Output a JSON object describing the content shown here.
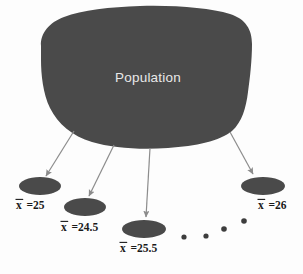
{
  "canvas": {
    "width": 303,
    "height": 274,
    "background_color": "#fdfdfd"
  },
  "colors": {
    "blob_fill": "#4a4a4a",
    "ellipse_fill": "#4a4a4a",
    "arrow_stroke": "#8c8c8c",
    "blob_label_color": "#e8e8e8",
    "sample_label_color": "#1a1a1a",
    "dot_color": "#3d3d3d"
  },
  "population": {
    "label": "Population",
    "label_x": 148,
    "label_y": 82,
    "shape_path": "M 41 46 C 40 33, 50 22, 64 17 C 82 10, 110 7, 140 6 C 176 5, 210 8, 230 14 C 246 19, 252 30, 252 44 C 252 60, 250 78, 248 92 C 246 108, 242 122, 232 131 C 220 141, 196 146, 168 148 C 140 150, 112 148, 92 142 C 72 136, 58 124, 50 108 C 43 94, 41 74, 41 60 Z"
  },
  "arrows": [
    {
      "name": "arrow-to-sample-1",
      "x1": 74,
      "y1": 131,
      "x2": 46,
      "y2": 176
    },
    {
      "name": "arrow-to-sample-2",
      "x1": 114,
      "y1": 145,
      "x2": 89,
      "y2": 196
    },
    {
      "name": "arrow-to-sample-3",
      "x1": 150,
      "y1": 148,
      "x2": 146,
      "y2": 217
    },
    {
      "name": "arrow-to-sample-4",
      "x1": 230,
      "y1": 132,
      "x2": 253,
      "y2": 174
    }
  ],
  "samples": [
    {
      "name": "sample-1",
      "ellipse_cx": 40,
      "ellipse_cy": 186,
      "ellipse_rx": 21,
      "ellipse_ry": 9,
      "label_prefix": "x",
      "label_value": "=25",
      "label_full": "x̄ =25",
      "label_x": 16,
      "label_y": 209
    },
    {
      "name": "sample-2",
      "ellipse_cx": 85,
      "ellipse_cy": 207,
      "ellipse_rx": 21,
      "ellipse_ry": 9,
      "label_prefix": "x",
      "label_value": "=24.5",
      "label_full": "x̄ =24.5",
      "label_x": 61,
      "label_y": 231
    },
    {
      "name": "sample-3",
      "ellipse_cx": 144,
      "ellipse_cy": 229,
      "ellipse_rx": 22,
      "ellipse_ry": 9,
      "label_prefix": "x",
      "label_value": "=25.5",
      "label_full": "x̄ =25.5",
      "label_x": 120,
      "label_y": 252
    },
    {
      "name": "sample-4",
      "ellipse_cx": 263,
      "ellipse_cy": 186,
      "ellipse_rx": 22,
      "ellipse_ry": 9,
      "label_prefix": "x",
      "label_value": "=26",
      "label_full": "x̄ =26",
      "label_x": 258,
      "label_y": 209
    }
  ],
  "ellipsis_dots": [
    {
      "cx": 184,
      "cy": 237,
      "r": 2.6
    },
    {
      "cx": 206,
      "cy": 236,
      "r": 2.6
    },
    {
      "cx": 224,
      "cy": 229,
      "r": 2.8
    },
    {
      "cx": 244,
      "cy": 221,
      "r": 2.8
    }
  ],
  "diagram": {
    "type": "statistics-sampling-diagram",
    "description_title": "Population and sample means diagram"
  }
}
